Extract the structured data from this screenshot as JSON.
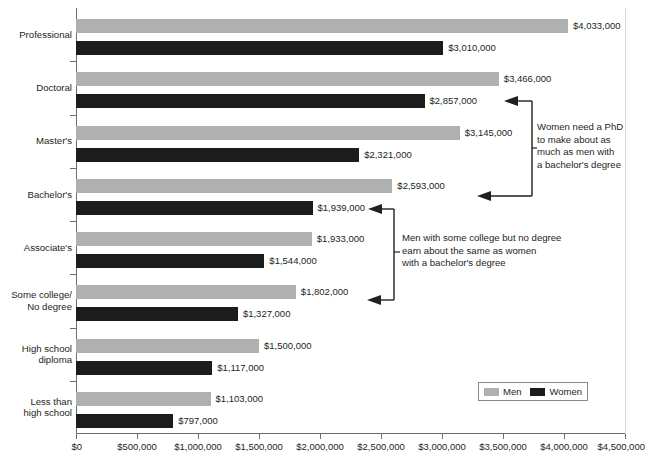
{
  "chart_data": {
    "type": "bar",
    "orientation": "horizontal",
    "title": "",
    "xlabel": "",
    "ylabel": "",
    "xlim": [
      0,
      4500000
    ],
    "grid": false,
    "legend_position": "bottom-right",
    "categories": [
      "Professional",
      "Doctoral",
      "Master's",
      "Bachelor's",
      "Associate's",
      "Some college/\nNo degree",
      "High school\ndiploma",
      "Less than\nhigh school"
    ],
    "series": [
      {
        "name": "Men",
        "color": "#b0b0b0",
        "values": [
          4033000,
          3466000,
          3145000,
          2593000,
          1933000,
          1802000,
          1500000,
          1103000
        ],
        "labels": [
          "$4,033,000",
          "$3,466,000",
          "$3,145,000",
          "$2,593,000",
          "$1,933,000",
          "$1,802,000",
          "$1,500,000",
          "$1,103,000"
        ]
      },
      {
        "name": "Women",
        "color": "#1c1c1c",
        "values": [
          3010000,
          2857000,
          2321000,
          1939000,
          1544000,
          1327000,
          1117000,
          797000
        ],
        "labels": [
          "$3,010,000",
          "$2,857,000",
          "$2,321,000",
          "$1,939,000",
          "$1,544,000",
          "$1,327,000",
          "$1,117,000",
          "$797,000"
        ]
      }
    ],
    "xticks": [
      0,
      500000,
      1000000,
      1500000,
      2000000,
      2500000,
      3000000,
      3500000,
      4000000,
      4500000
    ],
    "xticklabels": [
      "$0",
      "$500,000",
      "$1,000,000",
      "$1,500,000",
      "$2,000,000",
      "$2,500,000",
      "$3,000,000",
      "$3,500,000",
      "$4,000,000",
      "$4,500,000"
    ],
    "annotations": [
      {
        "text": "Women need a PhD\nto make about as\nmuch as men with\na bachelor's degree",
        "points_to": [
          "Women / Doctoral",
          "Men / Bachelor's"
        ]
      },
      {
        "text": "Men with some college but no degree\nearn about the same as women\nwith a bachelor's degree",
        "points_to": [
          "Women / Bachelor's",
          "Men / Some college/No degree"
        ]
      }
    ]
  },
  "legend": {
    "items": [
      {
        "label": "Men",
        "color": "#b0b0b0"
      },
      {
        "label": "Women",
        "color": "#1c1c1c"
      }
    ]
  }
}
